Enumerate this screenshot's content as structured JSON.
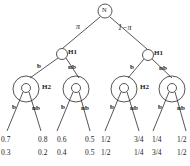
{
  "figure": {
    "type": "decision-tree-diagram",
    "root": {
      "label": "N",
      "name": "nature-node"
    },
    "root_edges": [
      {
        "label": "π",
        "side": "left"
      },
      {
        "label": "1−π",
        "side": "right"
      }
    ],
    "level1": [
      {
        "label": "H1",
        "side": "left"
      },
      {
        "label": "H1",
        "side": "right"
      }
    ],
    "level1_edges": [
      {
        "label": "b"
      },
      {
        "label": "nb"
      },
      {
        "label": "b"
      },
      {
        "label": "nb"
      }
    ],
    "level2": [
      {
        "label": "H2",
        "side": "left"
      },
      {
        "label": "H2",
        "side": "right"
      }
    ],
    "level2_edges": [
      {
        "label": "b"
      },
      {
        "label": "nb"
      },
      {
        "label": "b"
      },
      {
        "label": "nb"
      },
      {
        "label": "b"
      },
      {
        "label": "nb"
      },
      {
        "label": "b"
      },
      {
        "label": "nb"
      }
    ],
    "leaves": [
      {
        "top": "0.7",
        "bottom": "0.3"
      },
      {
        "top": "0.8",
        "bottom": "0.2"
      },
      {
        "top": "0.6",
        "bottom": "0.4"
      },
      {
        "top": "0.5",
        "bottom": "0.5"
      },
      {
        "top": "1/2",
        "bottom": "1/2"
      },
      {
        "top": "3/4",
        "bottom": "1/4"
      },
      {
        "top": "1/4",
        "bottom": "3/4"
      },
      {
        "top": "1/2",
        "bottom": "1/2"
      }
    ],
    "colors": {
      "stroke": "#2b2b2b",
      "text": "#1a1a1a",
      "background": "#ffffff"
    }
  }
}
